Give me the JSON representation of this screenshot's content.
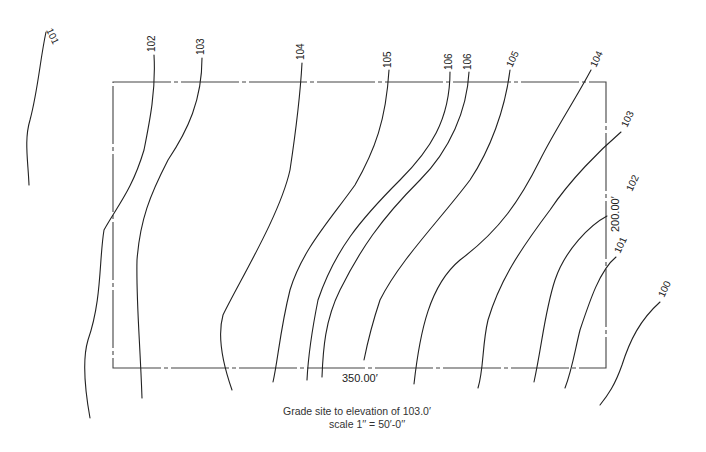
{
  "site": {
    "boundary": {
      "x": 113,
      "y": 82,
      "width": 493,
      "height": 286
    },
    "width_dimension": "350.00′",
    "depth_dimension": "200.00′"
  },
  "contours": [
    {
      "elevation": "101",
      "label": "101",
      "label_x": 46,
      "label_y": 30,
      "angle": 65,
      "path": "M46,32 C40,60 38,90 30,120 C24,140 28,160 29,185"
    },
    {
      "elevation": "102",
      "label": "102",
      "label_x": 155,
      "label_y": 52,
      "angle": -90,
      "path": "M154,55 C156,90 150,120 144,150 C132,190 118,205 104,230 C99,260 102,300 88,340 C82,360 85,390 90,418"
    },
    {
      "elevation": "103",
      "label": "103",
      "label_x": 204,
      "label_y": 55,
      "angle": -90,
      "path": "M202,58 C202,100 188,130 168,160 C150,195 140,220 137,260 C136,300 140,340 142,398"
    },
    {
      "elevation": "104",
      "label": "104",
      "label_x": 304,
      "label_y": 60,
      "angle": -90,
      "path": "M302,63 C300,100 296,130 290,170 C280,215 240,280 223,315 C216,340 225,370 232,390"
    },
    {
      "elevation": "105",
      "label": "105",
      "label_x": 391,
      "label_y": 68,
      "angle": -90,
      "path": "M389,70 C386,120 375,150 355,185 C330,220 302,250 290,290 C280,330 278,360 273,382"
    },
    {
      "elevation": "106",
      "label": "106",
      "label_x": 452,
      "label_y": 70,
      "angle": -90,
      "path": "M450,72 C450,120 430,150 400,180 C360,220 335,250 318,300 C310,340 308,360 307,380"
    },
    {
      "elevation": "106",
      "label": "106",
      "label_x": 471,
      "label_y": 70,
      "angle": -90,
      "path": "M469,72 C467,110 450,150 420,180 C380,220 360,250 340,290 C325,320 323,350 322,377"
    },
    {
      "elevation": "105",
      "label": "105",
      "label_x": 512,
      "label_y": 68,
      "angle": -65,
      "path": "M510,70 C505,110 490,150 470,180 C440,220 400,260 380,300 C370,330 366,350 364,360"
    },
    {
      "elevation": "104",
      "label": "104",
      "label_x": 596,
      "label_y": 68,
      "angle": -65,
      "path": "M591,70 C575,100 555,130 540,160 C520,200 500,230 460,260 C430,285 420,330 414,384"
    },
    {
      "elevation": "103",
      "label": "103",
      "label_x": 627,
      "label_y": 128,
      "angle": -65,
      "path": "M621,132 C600,150 570,180 550,210 C520,250 500,280 488,320 C482,345 484,368 478,388"
    },
    {
      "elevation": "102",
      "label": "102",
      "label_x": 632,
      "label_y": 192,
      "angle": -65,
      "path": "M607,216 C590,225 565,250 555,280 C545,310 542,345 534,382"
    },
    {
      "elevation": "101",
      "label": "101",
      "label_x": 620,
      "label_y": 254,
      "angle": -65,
      "path": "M616,257 C600,270 590,300 580,330 C575,350 572,370 565,388"
    },
    {
      "elevation": "100",
      "label": "100",
      "label_x": 664,
      "label_y": 298,
      "angle": -65,
      "path": "M660,302 C640,320 630,340 622,365 C615,385 608,395 600,405"
    }
  ],
  "notes": {
    "line1": "Grade site to elevation of 103.0′",
    "line2": "scale 1′′ = 50′-0′′"
  }
}
